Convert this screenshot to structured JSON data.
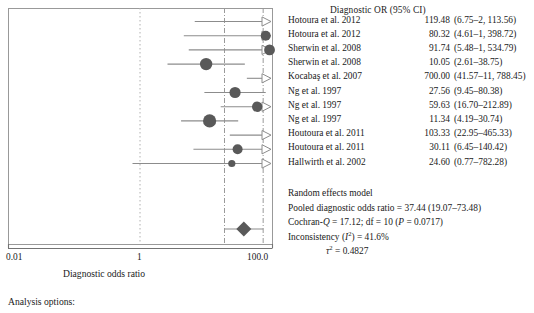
{
  "table": {
    "header": "Diagnostic OR (95% CI)",
    "rows": [
      {
        "study": "Hotoura et al. 2012",
        "estimate": "119.48",
        "ci": "(6.75–2, 113.56)",
        "or": 119.48,
        "lower": 6.75,
        "upper": 2113.56,
        "size": 3.4,
        "arrow": true
      },
      {
        "study": "Hotoura et al. 2012",
        "estimate": "80.32",
        "ci": "(4.61–1, 398.72)",
        "or": 80.32,
        "lower": 4.61,
        "upper": 1398.72,
        "size": 5.0,
        "arrow": true
      },
      {
        "study": "Sherwin et al. 2008",
        "estimate": "91.74",
        "ci": "(5.48–1, 534.79)",
        "or": 91.74,
        "lower": 5.48,
        "upper": 1534.79,
        "size": 5.4,
        "arrow": true
      },
      {
        "study": "Sherwin et al. 2008",
        "estimate": "10.05",
        "ci": "(2.61–38.75)",
        "or": 10.05,
        "lower": 2.61,
        "upper": 38.75,
        "size": 6.2,
        "arrow": false
      },
      {
        "study": "Kocabaş et al. 2007",
        "estimate": "700.00",
        "ci": "(41.57–11, 788.45)",
        "or": 700.0,
        "lower": 41.57,
        "upper": 11788.45,
        "size": 3.2,
        "arrow": true
      },
      {
        "study": "Ng et al. 1997",
        "estimate": "27.56",
        "ci": "(9.45–80.38)",
        "or": 27.56,
        "lower": 9.45,
        "upper": 80.38,
        "size": 5.6,
        "arrow": false
      },
      {
        "study": "Ng et al. 1997",
        "estimate": "59.63",
        "ci": "(16.70–212.89)",
        "or": 59.63,
        "lower": 16.7,
        "upper": 212.89,
        "size": 5.2,
        "arrow": true
      },
      {
        "study": "Ng et al. 1997",
        "estimate": "11.34",
        "ci": "(4.19–30.74)",
        "or": 11.34,
        "lower": 4.19,
        "upper": 30.74,
        "size": 6.6,
        "arrow": false
      },
      {
        "study": "Houtoura et al. 2011",
        "estimate": "103.33",
        "ci": "(22.95–465.33)",
        "or": 103.33,
        "lower": 22.95,
        "upper": 465.33,
        "size": 3.0,
        "arrow": true
      },
      {
        "study": "Houtoura et al. 2011",
        "estimate": "30.11",
        "ci": "(6.45–140.42)",
        "or": 30.11,
        "lower": 6.45,
        "upper": 140.42,
        "size": 5.0,
        "arrow": true
      },
      {
        "study": "Hallwirth et al. 2002",
        "estimate": "24.60",
        "ci": "(0.77–782.28)",
        "or": 24.6,
        "lower": 0.77,
        "upper": 782.28,
        "size": 3.6,
        "arrow": true
      }
    ]
  },
  "summary": {
    "model": "Random effects model",
    "pooled": "Pooled diagnostic odds ratio = 37.44 (19.07–73.48)",
    "cochran_pre": "Cochran-",
    "cochran_q": "Q",
    "cochran_post": " = 17.12; df = 10 (",
    "cochran_p": "P",
    "cochran_end": " =  0.0717)",
    "inconsistency_pre": "Inconsistency (",
    "inconsistency_i": "I",
    "inconsistency_sup": "2",
    "inconsistency_post": ") = 41.6%",
    "tau_symbol": "τ",
    "tau_sup": "2",
    "tau_value": " = 0.4827"
  },
  "axis": {
    "tick_left": "0.01",
    "tick_mid": "1",
    "tick_right": "100.0",
    "title": "Diagnostic odds ratio",
    "min": 0.01,
    "max": 100.0,
    "null_value": 1
  },
  "pooled_marker": {
    "or": 37.44,
    "lower": 19.07,
    "upper": 73.48
  },
  "footer": {
    "analysis_options": "Analysis options:"
  },
  "colors": {
    "marker": "#595959",
    "line": "#8c8c8c",
    "box": "#999999",
    "axis": "#737373",
    "text": "#1a1a1a",
    "dotted": "#b0b0b0",
    "dashdot": "#9a9a9a"
  }
}
